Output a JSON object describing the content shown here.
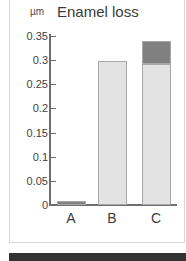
{
  "panel": {
    "unit_label": "µm",
    "title": "Enamel loss"
  },
  "chart_data": {
    "type": "bar",
    "title": "Enamel loss",
    "xlabel": "",
    "ylabel": "µm",
    "ylim": [
      0,
      0.35
    ],
    "yticks": [
      "0",
      "0.05",
      "0.1",
      "0.15",
      "0.2",
      "0.25",
      "0.3",
      "0.35"
    ],
    "ytick_values": [
      0,
      0.05,
      0.1,
      0.15,
      0.2,
      0.25,
      0.3,
      0.35
    ],
    "grid": false,
    "legend": "none",
    "stacked": true,
    "categories": [
      "A",
      "B",
      "C"
    ],
    "series": [
      {
        "name": "light-segment",
        "color": "#e3e3e3",
        "values": [
          0,
          0.298,
          0.293
        ]
      },
      {
        "name": "dark-segment",
        "color": "#808080",
        "values": [
          0.008,
          0,
          0.047
        ]
      }
    ],
    "totals": [
      0.008,
      0.298,
      0.34
    ],
    "colors": {
      "light": "#e3e3e3",
      "dark": "#808080",
      "outline": "#a8a8a8",
      "axis": "#6e6e6e",
      "text": "#3a3a3a"
    }
  }
}
